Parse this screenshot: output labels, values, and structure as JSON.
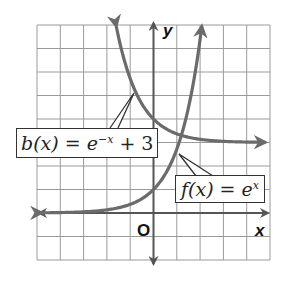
{
  "chart_data": {
    "type": "line",
    "title": "",
    "xlabel": "x",
    "ylabel": "y",
    "origin_label": "O",
    "xlim": [
      -5,
      5
    ],
    "ylim": [
      -2,
      8
    ],
    "grid": true,
    "grid_step": 1,
    "series": [
      {
        "name": "f(x) = e^x",
        "label_parts": {
          "fn": "f(x) = e",
          "exp": "x"
        },
        "expression": "e^x",
        "color": "#6b6b6b",
        "x": [
          -5,
          -4,
          -3,
          -2,
          -1,
          0,
          1,
          2
        ],
        "y": [
          0.007,
          0.018,
          0.05,
          0.135,
          0.368,
          1,
          2.718,
          7.389
        ]
      },
      {
        "name": "b(x) = e^-x + 3",
        "label_parts": {
          "fn": "b(x) = e",
          "exp": "−x",
          "tail": " + 3"
        },
        "expression": "e^-x + 3",
        "color": "#6b6b6b",
        "x": [
          -1.6,
          -1,
          0,
          1,
          2,
          3,
          4,
          5
        ],
        "y": [
          7.95,
          5.718,
          4,
          3.368,
          3.135,
          3.05,
          3.018,
          3.007
        ]
      }
    ],
    "colors": {
      "grid": "#9a9a9a",
      "axis": "#555555",
      "curve": "#6b6b6b"
    }
  }
}
